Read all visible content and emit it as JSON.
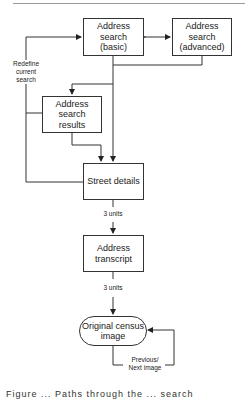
{
  "diagram": {
    "nodes": [
      {
        "id": "basic",
        "label": "Address\nsearch\n(basic)"
      },
      {
        "id": "advanced",
        "label": "Address\nsearch\n(advanced)"
      },
      {
        "id": "results",
        "label": "Address\nsearch\nresults"
      },
      {
        "id": "street",
        "label": "Street details"
      },
      {
        "id": "transcript",
        "label": "Address\ntranscript"
      },
      {
        "id": "census",
        "label": "Original census\nimage"
      }
    ],
    "edge_labels": {
      "redefine": "Redefine\ncurrent\nsearch",
      "street_to_transcript": "3 units",
      "transcript_to_census": "3 units",
      "loop": "Previous/\nNext image"
    },
    "edges": [
      {
        "from": "basic",
        "to": "advanced",
        "bidirectional": true
      },
      {
        "from": "basic",
        "to": "results"
      },
      {
        "from": "advanced",
        "to": "results"
      },
      {
        "from": "basic",
        "to": "street"
      },
      {
        "from": "results",
        "to": "street"
      },
      {
        "from": "street",
        "to": "basic",
        "label": "Redefine current search"
      },
      {
        "from": "results",
        "to": "basic"
      },
      {
        "from": "street",
        "to": "transcript",
        "label": "3 units"
      },
      {
        "from": "transcript",
        "to": "census",
        "label": "3 units"
      },
      {
        "from": "census",
        "to": "census",
        "label": "Previous/ Next image"
      }
    ]
  },
  "caption": "Figure ... Paths through the ... search"
}
